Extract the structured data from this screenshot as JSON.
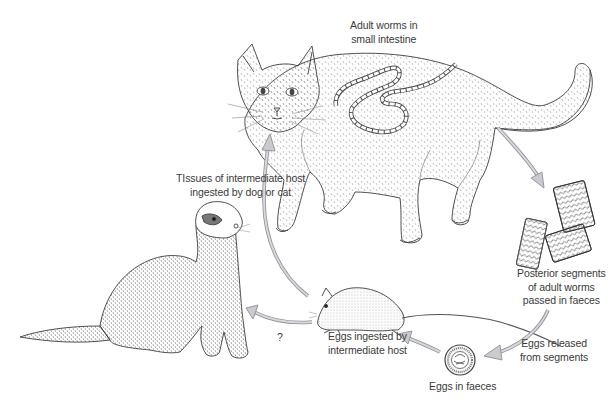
{
  "diagram": {
    "colors": {
      "background": "#ffffff",
      "line_art": "#3c3c3c",
      "arrow_fill": "#c9cbce",
      "arrow_stroke": "#8d9096",
      "text": "#3a3a3a"
    },
    "nodes": [
      {
        "id": "cat",
        "depicts": "cat (definitive host)"
      },
      {
        "id": "worm-segments",
        "depicts": "gravid proglottids"
      },
      {
        "id": "egg",
        "depicts": "egg"
      },
      {
        "id": "mouse",
        "depicts": "mouse (intermediate host)"
      },
      {
        "id": "ferret",
        "depicts": "ferret"
      }
    ],
    "labels": {
      "adult_worms": [
        "Adult worms in",
        "small intestine"
      ],
      "posterior_segments": [
        "Posterior segments",
        "of adult worms",
        "passed in faeces"
      ],
      "eggs_released": [
        "Eggs released",
        "from segments"
      ],
      "eggs_in_faeces": [
        "Eggs in faeces"
      ],
      "eggs_ingested": [
        "Eggs ingested by",
        "intermediate host"
      ],
      "tissues_ingested": [
        "TIssues of intermediate host",
        "ingested by dog or cat"
      ],
      "question_mark": "?"
    },
    "arrows": [
      {
        "from": "cat",
        "to": "worm-segments"
      },
      {
        "from": "worm-segments",
        "to": "egg"
      },
      {
        "from": "egg",
        "to": "mouse"
      },
      {
        "from": "mouse",
        "to": "cat"
      },
      {
        "from": "mouse",
        "to": "ferret",
        "label": "?"
      }
    ]
  }
}
